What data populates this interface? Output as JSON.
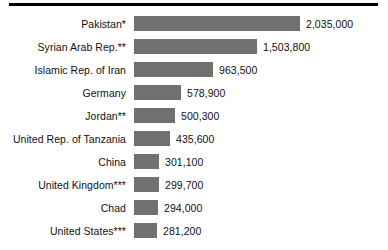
{
  "chart_data": {
    "type": "bar",
    "orientation": "horizontal",
    "title": "",
    "subtitle": "",
    "xlabel": "",
    "ylabel": "",
    "grid": false,
    "legend": null,
    "axis_visible": false,
    "value_labels_shown": true,
    "bar_color": "#70706f",
    "rule_color": "#000000",
    "background_color": "#ffffff",
    "xlim": [
      0,
      2035000
    ],
    "categories": [
      "Pakistan*",
      "Syrian Arab Rep.**",
      "Islamic Rep. of Iran",
      "Germany",
      "Jordan**",
      "United Rep. of Tanzania",
      "China",
      "United Kingdom***",
      "Chad",
      "United States***"
    ],
    "values": [
      2035000,
      1503800,
      963500,
      578900,
      500300,
      435600,
      301100,
      299700,
      294000,
      281200
    ],
    "value_labels": [
      "2,035,000",
      "1,503,800",
      "963,500",
      "578,900",
      "500,300",
      "435,600",
      "301,100",
      "299,700",
      "294,000",
      "281,200"
    ],
    "rows": [
      {
        "label": "Pakistan*",
        "value": 2035000,
        "value_label": "2,035,000",
        "bar_px": 166
      },
      {
        "label": "Syrian Arab Rep.**",
        "value": 1503800,
        "value_label": "1,503,800",
        "bar_px": 123
      },
      {
        "label": "Islamic Rep. of Iran",
        "value": 963500,
        "value_label": "963,500",
        "bar_px": 79
      },
      {
        "label": "Germany",
        "value": 578900,
        "value_label": "578,900",
        "bar_px": 47
      },
      {
        "label": "Jordan**",
        "value": 500300,
        "value_label": "500,300",
        "bar_px": 41
      },
      {
        "label": "United Rep. of Tanzania",
        "value": 435600,
        "value_label": "435,600",
        "bar_px": 36
      },
      {
        "label": "China",
        "value": 301100,
        "value_label": "301,100",
        "bar_px": 25
      },
      {
        "label": "United Kingdom***",
        "value": 299700,
        "value_label": "299,700",
        "bar_px": 25
      },
      {
        "label": "Chad",
        "value": 294000,
        "value_label": "294,000",
        "bar_px": 24
      },
      {
        "label": "United States***",
        "value": 281200,
        "value_label": "281,200",
        "bar_px": 23
      }
    ]
  }
}
